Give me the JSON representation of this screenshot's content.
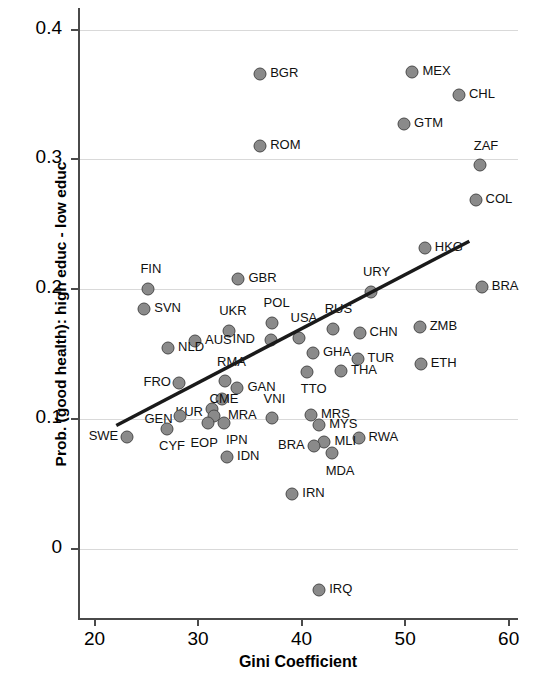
{
  "chart_data": {
    "type": "scatter",
    "title": "",
    "xlabel": "Gini Coefficient",
    "ylabel": "Prob. (good health): high educ - low educ",
    "xlim": [
      18.4,
      60.9
    ],
    "ylim": [
      -0.055,
      0.4167
    ],
    "xticks": [
      20,
      30,
      40,
      50,
      60
    ],
    "xtick_labels": [
      "20",
      "30",
      "40",
      "50",
      "60"
    ],
    "yticks": [
      0,
      0.1,
      0.2,
      0.3,
      0.4
    ],
    "ytick_labels": [
      "0",
      "0.1",
      "0.2",
      "0.3",
      "0.4"
    ],
    "grid": "horizontal",
    "legend": "none",
    "marker_color": "#8a8a8a",
    "marker_edge_color": "#4a4a4a",
    "fit_line": {
      "color": "#1a1a1a",
      "x_start": 22.1,
      "y_start": 0.095,
      "x_end": 56.2,
      "y_end": 0.237
    },
    "points": [
      {
        "label": "BGR",
        "x": 36.0,
        "y": 0.3655,
        "lx": 10,
        "ly": -6
      },
      {
        "label": "MEX",
        "x": 50.7,
        "y": 0.3675,
        "lx": 10,
        "ly": -6
      },
      {
        "label": "CHL",
        "x": 55.2,
        "y": 0.35,
        "lx": 10,
        "ly": -6
      },
      {
        "label": "GTM",
        "x": 49.9,
        "y": 0.327,
        "lx": 10,
        "ly": -6
      },
      {
        "label": "ROM",
        "x": 36.0,
        "y": 0.31,
        "lx": 10,
        "ly": -6
      },
      {
        "label": "ZAF",
        "x": 57.2,
        "y": 0.296,
        "lx": -6,
        "ly": -24
      },
      {
        "label": "COL",
        "x": 56.8,
        "y": 0.269,
        "lx": 10,
        "ly": -6
      },
      {
        "label": "HKG",
        "x": 51.9,
        "y": 0.232,
        "lx": 10,
        "ly": -6
      },
      {
        "label": "BRA",
        "x": 57.4,
        "y": 0.202,
        "lx": 10,
        "ly": -6
      },
      {
        "label": "FIN",
        "x": 25.2,
        "y": 0.2,
        "lx": -8,
        "ly": -25
      },
      {
        "label": "GBR",
        "x": 33.9,
        "y": 0.208,
        "lx": 10,
        "ly": -6
      },
      {
        "label": "URY",
        "x": 46.7,
        "y": 0.198,
        "lx": -8,
        "ly": -25
      },
      {
        "label": "SVN",
        "x": 24.8,
        "y": 0.185,
        "lx": 10,
        "ly": -6
      },
      {
        "label": "POL",
        "x": 37.1,
        "y": 0.174,
        "lx": -8,
        "ly": -25
      },
      {
        "label": "RUS",
        "x": 43.0,
        "y": 0.169,
        "lx": -8,
        "ly": -25
      },
      {
        "label": "UKR",
        "x": 33.0,
        "y": 0.168,
        "lx": -10,
        "ly": -25
      },
      {
        "label": "ZMB",
        "x": 51.4,
        "y": 0.171,
        "lx": 10,
        "ly": -6
      },
      {
        "label": "CHN",
        "x": 45.6,
        "y": 0.166,
        "lx": 10,
        "ly": -6
      },
      {
        "label": "USA",
        "x": 39.7,
        "y": 0.162,
        "lx": -8,
        "ly": -25
      },
      {
        "label": "IND",
        "x": 37.0,
        "y": 0.161,
        "lx": -38,
        "ly": -6
      },
      {
        "label": "AUS",
        "x": 29.7,
        "y": 0.16,
        "lx": 10,
        "ly": -6
      },
      {
        "label": "NLD",
        "x": 27.1,
        "y": 0.155,
        "lx": 10,
        "ly": -6
      },
      {
        "label": "GHA",
        "x": 41.1,
        "y": 0.151,
        "lx": 10,
        "ly": -6
      },
      {
        "label": "TUR",
        "x": 45.4,
        "y": 0.146,
        "lx": 10,
        "ly": -6
      },
      {
        "label": "ETH",
        "x": 51.5,
        "y": 0.142,
        "lx": 10,
        "ly": -6
      },
      {
        "label": "THA",
        "x": 43.8,
        "y": 0.137,
        "lx": 10,
        "ly": -6
      },
      {
        "label": "TTO",
        "x": 40.5,
        "y": 0.136,
        "lx": -6,
        "ly": 12
      },
      {
        "label": "RMA",
        "x": 32.6,
        "y": 0.1295,
        "lx": -8,
        "ly": -24
      },
      {
        "label": "FRO",
        "x": 28.2,
        "y": 0.128,
        "lx": -36,
        "ly": -6
      },
      {
        "label": "GAN",
        "x": 33.8,
        "y": 0.124,
        "lx": 10,
        "ly": -6
      },
      {
        "label": "MRA",
        "x": 32.3,
        "y": 0.115,
        "lx": 6,
        "ly": 11
      },
      {
        "label": "KUR",
        "x": 31.3,
        "y": 0.108,
        "lx": -36,
        "ly": -2
      },
      {
        "label": "MRS",
        "x": 40.9,
        "y": 0.103,
        "lx": 10,
        "ly": -6
      },
      {
        "label": "GEN",
        "x": 28.3,
        "y": 0.102,
        "lx": -36,
        "ly": -2
      },
      {
        "label": "CME",
        "x": 31.5,
        "y": 0.102,
        "lx": -4,
        "ly": -22
      },
      {
        "label": "VNI",
        "x": 37.1,
        "y": 0.101,
        "lx": -8,
        "ly": -24
      },
      {
        "label": "MYS",
        "x": 41.7,
        "y": 0.095,
        "lx": 10,
        "ly": -6
      },
      {
        "label": "CYF",
        "x": 27.0,
        "y": 0.092,
        "lx": -8,
        "ly": 12
      },
      {
        "label": "IPN",
        "x": 32.5,
        "y": 0.0965,
        "lx": 2,
        "ly": 12
      },
      {
        "label": "EOP",
        "x": 31.0,
        "y": 0.0965,
        "lx": -18,
        "ly": 15
      },
      {
        "label": "SWE",
        "x": 23.1,
        "y": 0.086,
        "lx": -38,
        "ly": -6
      },
      {
        "label": "RWA",
        "x": 45.5,
        "y": 0.085,
        "lx": 10,
        "ly": -6
      },
      {
        "label": "MLI",
        "x": 42.2,
        "y": 0.082,
        "lx": 10,
        "ly": -6
      },
      {
        "label": "BRA",
        "x": 41.2,
        "y": 0.079,
        "lx": -36,
        "ly": -6
      },
      {
        "label": "MDA",
        "x": 42.9,
        "y": 0.074,
        "lx": -6,
        "ly": 13
      },
      {
        "label": "IDN",
        "x": 32.8,
        "y": 0.071,
        "lx": 10,
        "ly": -6
      },
      {
        "label": "IRN",
        "x": 39.1,
        "y": 0.042,
        "lx": 10,
        "ly": -6
      },
      {
        "label": "IRQ",
        "x": 41.7,
        "y": -0.032,
        "lx": 10,
        "ly": -6
      }
    ]
  }
}
